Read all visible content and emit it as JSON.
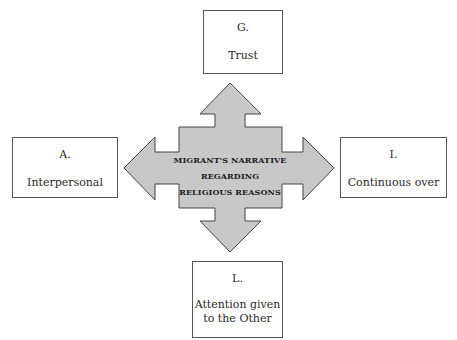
{
  "diagram": {
    "center": {
      "line1": "MIGRANT'S NARRATIVE REGARDING",
      "line2": "RELIGIOUS REASONS",
      "fill": "#c8c8c8",
      "stroke": "#444444"
    },
    "boxes": {
      "top": {
        "letter": "G.",
        "label": "Trust"
      },
      "left": {
        "letter": "A.",
        "label": "Interpersonal"
      },
      "right": {
        "letter": "I.",
        "label": "Continuous over"
      },
      "bottom": {
        "letter": "L.",
        "label_line1": "Attention given",
        "label_line2": "to the Other"
      }
    }
  }
}
